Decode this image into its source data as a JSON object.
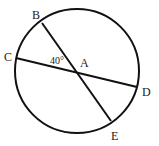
{
  "diagram": {
    "type": "circle-with-intersecting-chords",
    "stroke_color": "#111111",
    "circle": {
      "cx": 77,
      "cy": 71,
      "r": 62
    },
    "points": {
      "A": {
        "x": 76,
        "y": 71,
        "label": "A",
        "lx": 80,
        "ly": 67
      },
      "B": {
        "x": 42,
        "y": 23,
        "label": "B",
        "lx": 32,
        "ly": 19
      },
      "C": {
        "x": 16,
        "y": 58,
        "label": "C",
        "lx": 4,
        "ly": 61
      },
      "D": {
        "x": 137,
        "y": 87,
        "label": "D",
        "lx": 142,
        "ly": 96
      },
      "E": {
        "x": 111,
        "y": 121,
        "label": "E",
        "lx": 111,
        "ly": 140
      }
    },
    "segments": [
      {
        "from": "B",
        "to": "E"
      },
      {
        "from": "C",
        "to": "D"
      }
    ],
    "angle_label": {
      "text": "40°",
      "x": 50,
      "y": 65,
      "between": [
        "B",
        "C"
      ],
      "vertex": "A"
    }
  },
  "labels": {
    "A": "A",
    "B": "B",
    "C": "C",
    "D": "D",
    "E": "E",
    "angle": "40°"
  }
}
